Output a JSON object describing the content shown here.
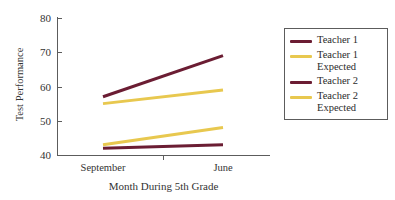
{
  "chart_data": {
    "type": "line",
    "title": "",
    "xlabel": "Month During 5th Grade",
    "ylabel": "Test Performance",
    "categories": [
      "September",
      "June"
    ],
    "x": [
      0,
      1
    ],
    "ylim": [
      40,
      80
    ],
    "yticks": [
      40,
      50,
      60,
      70,
      80
    ],
    "grid": false,
    "legend_position": "right",
    "series": [
      {
        "name": "Teacher 1",
        "values": [
          57,
          69
        ],
        "color": "#6b1d33"
      },
      {
        "name": "Teacher 1 Expected",
        "values": [
          55,
          59
        ],
        "color": "#e8c84f"
      },
      {
        "name": "Teacher 2",
        "values": [
          42,
          43
        ],
        "color": "#6b1d33"
      },
      {
        "name": "Teacher 2 Expected",
        "values": [
          43,
          48
        ],
        "color": "#e8c84f"
      }
    ]
  },
  "axes": {
    "y_title": "Test Performance",
    "x_title": "Month During 5th Grade",
    "y_tick_labels": [
      "80",
      "70",
      "60",
      "50",
      "40"
    ],
    "x_tick_labels": [
      "September",
      "June"
    ]
  },
  "legend": {
    "entries": [
      {
        "label": "Teacher 1",
        "color": "#6b1d33"
      },
      {
        "label": "Teacher 1\nExpected",
        "color": "#e8c84f"
      },
      {
        "label": "Teacher 2",
        "color": "#6b1d33"
      },
      {
        "label": "Teacher 2\nExpected",
        "color": "#e8c84f"
      }
    ]
  },
  "colors": {
    "maroon": "#6b1d33",
    "gold": "#e8c84f",
    "axis": "#5c5c5c",
    "text": "#333333",
    "background": "#ffffff"
  }
}
